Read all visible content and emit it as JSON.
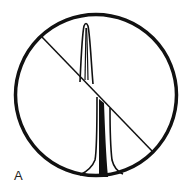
{
  "figure": {
    "label": "A",
    "colors": {
      "stroke": "#111111",
      "background": "#ffffff"
    }
  }
}
